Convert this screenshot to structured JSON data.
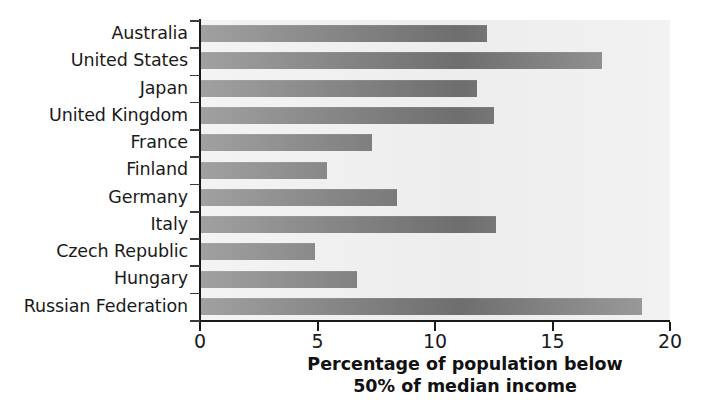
{
  "chart_data": {
    "type": "bar",
    "orientation": "horizontal",
    "title": "",
    "xlabel": "Percentage of population below 50% of median income",
    "ylabel": "",
    "xlim": [
      0,
      20
    ],
    "xticks": [
      0,
      5,
      10,
      15,
      20
    ],
    "xtick_labels": [
      "0",
      "5",
      "10",
      "15",
      "20"
    ],
    "grid": false,
    "legend": null,
    "categories": [
      "Australia",
      "United States",
      "Japan",
      "United Kingdom",
      "France",
      "Finland",
      "Germany",
      "Italy",
      "Czech Republic",
      "Hungary",
      "Russian Federation"
    ],
    "values": [
      12.2,
      17.1,
      11.8,
      12.5,
      7.3,
      5.4,
      8.4,
      12.6,
      4.9,
      6.7,
      18.8
    ],
    "series": [
      {
        "name": "Percentage of population below 50% of median income",
        "values": [
          12.2,
          17.1,
          11.8,
          12.5,
          7.3,
          5.4,
          8.4,
          12.6,
          4.9,
          6.7,
          18.8
        ]
      }
    ],
    "bar_color": "#6e6e6e",
    "plot_background": "#ededed",
    "axis_color": "#1a1a1a"
  },
  "axis_title": {
    "line1": "Percentage of population below",
    "line2": "50% of median income"
  }
}
